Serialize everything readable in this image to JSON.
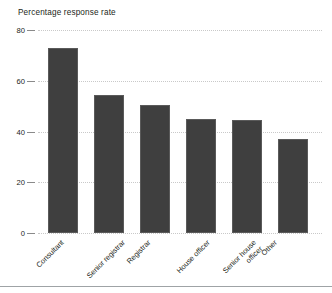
{
  "chart_data": {
    "type": "bar",
    "title": "Percentage response rate",
    "xlabel": "",
    "ylabel": "Percentage response rate",
    "categories": [
      "Consultant",
      "Senior registrar",
      "Registrar",
      "House officer",
      "Senior house officer",
      "Other"
    ],
    "category_lines": [
      [
        "Consultant"
      ],
      [
        "Senior registrar"
      ],
      [
        "Registrar"
      ],
      [
        "House officer"
      ],
      [
        "Senior house",
        "officer"
      ],
      [
        "Other"
      ]
    ],
    "values": [
      73,
      54.5,
      50.5,
      45,
      44.5,
      37
    ],
    "ylim": [
      0,
      80
    ],
    "yticks": [
      0,
      20,
      40,
      60,
      80
    ],
    "ytick_labels": [
      "0",
      "20",
      "40",
      "60",
      "80"
    ],
    "grid": "horizontal-dotted",
    "legend": "none",
    "bar_color": "#3f3f3f",
    "grid_color": "#c9c9c9",
    "text_color": "#231f20"
  },
  "axis": {
    "ytick_0": "0",
    "ytick_1": "20",
    "ytick_2": "40",
    "ytick_3": "60",
    "ytick_4": "80"
  },
  "labels": {
    "cat_0": "Consultant",
    "cat_1": "Senior registrar",
    "cat_2": "Registrar",
    "cat_3": "House officer",
    "cat_4_line1": "Senior house",
    "cat_4_line2": "officer",
    "cat_5": "Other"
  }
}
